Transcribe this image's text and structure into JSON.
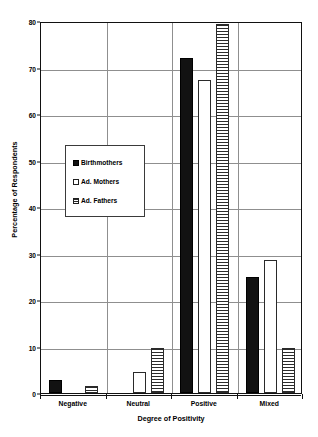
{
  "chart_data": {
    "type": "bar",
    "title": "",
    "xlabel": "Degree of Positivity",
    "ylabel": "Percentage of Respondents",
    "categories": [
      "Negative",
      "Neutral",
      "Positive",
      "Mixed"
    ],
    "series": [
      {
        "name": "Birthmothers",
        "marker": "solid-black-square",
        "values": [
          2.8,
          0,
          72.0,
          25.0
        ]
      },
      {
        "name": "Ad. Mothers",
        "marker": "open-white-square",
        "values": [
          0,
          4.5,
          67.3,
          28.5
        ]
      },
      {
        "name": "Ad. Fathers",
        "marker": "hatched-square",
        "values": [
          1.5,
          9.7,
          79.3,
          9.7
        ]
      }
    ],
    "ylim": [
      0,
      80
    ],
    "yticks": [
      0,
      10,
      20,
      30,
      40,
      50,
      60,
      70,
      80
    ],
    "ytick_labels": [
      "0",
      "10",
      "20",
      "30",
      "40",
      "50",
      "60",
      "70",
      "80"
    ],
    "grid": "horizontal-and-category-separators",
    "legend_position": "inside-left-upper-middle",
    "colors": {
      "birthmothers": "#121212",
      "ad_mothers": "#ffffff",
      "ad_fathers": "#2b2b2b",
      "gridline": "#8f8f8f",
      "axis": "#111111",
      "background": "#ffffff"
    }
  }
}
